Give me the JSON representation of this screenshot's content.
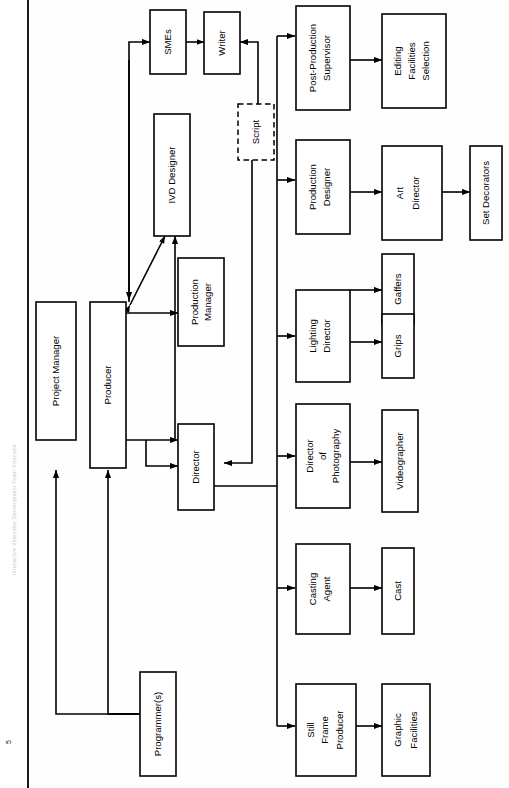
{
  "document": {
    "page_number": "5",
    "side_caption": "Interactive Videodisc Development Team Structure"
  },
  "diagram": {
    "type": "organizational-flow-chart",
    "orientation": "rotated-90-counterclockwise",
    "nodes": [
      {
        "id": "project-manager",
        "label": "Project Manager",
        "lines": [
          "Project Manager"
        ],
        "style": "solid"
      },
      {
        "id": "producer",
        "label": "Producer",
        "lines": [
          "Producer"
        ],
        "style": "solid"
      },
      {
        "id": "programmers",
        "label": "Programmer(s)",
        "lines": [
          "Programmer(s)"
        ],
        "style": "solid"
      },
      {
        "id": "smes",
        "label": "SMEs",
        "lines": [
          "SMEs"
        ],
        "style": "solid"
      },
      {
        "id": "writer",
        "label": "Writer",
        "lines": [
          "Writer"
        ],
        "style": "solid"
      },
      {
        "id": "script",
        "label": "Script",
        "lines": [
          "Script"
        ],
        "style": "dashed"
      },
      {
        "id": "ivd-designer",
        "label": "IVD Designer",
        "lines": [
          "IVD Designer"
        ],
        "style": "solid"
      },
      {
        "id": "production-manager",
        "label": "Production Manager",
        "lines": [
          "Production",
          "Manager"
        ],
        "style": "solid"
      },
      {
        "id": "director",
        "label": "Director",
        "lines": [
          "Director"
        ],
        "style": "solid"
      },
      {
        "id": "post-production-supervisor",
        "label": "Post-Production Supervisor",
        "lines": [
          "Post-Production",
          "Supervisor"
        ],
        "style": "solid"
      },
      {
        "id": "editing-facilities-selection",
        "label": "Editing Facilities Selection",
        "lines": [
          "Editing",
          "Facilities",
          "Selection"
        ],
        "style": "solid"
      },
      {
        "id": "production-designer",
        "label": "Production Designer",
        "lines": [
          "Production",
          "Designer"
        ],
        "style": "solid"
      },
      {
        "id": "art-director",
        "label": "Art Director",
        "lines": [
          "Art",
          "Director"
        ],
        "style": "solid"
      },
      {
        "id": "set-decorators",
        "label": "Set Decorators",
        "lines": [
          "Set Decorators"
        ],
        "style": "solid"
      },
      {
        "id": "lighting-director",
        "label": "Lighting Director",
        "lines": [
          "Lighting",
          "Director"
        ],
        "style": "solid"
      },
      {
        "id": "gaffers",
        "label": "Gaffers",
        "lines": [
          "Gaffers"
        ],
        "style": "solid"
      },
      {
        "id": "grips",
        "label": "Grips",
        "lines": [
          "Grips"
        ],
        "style": "solid"
      },
      {
        "id": "director-of-photography",
        "label": "Director of Photography",
        "lines": [
          "Director",
          "of",
          "Photography"
        ],
        "style": "solid"
      },
      {
        "id": "videographer",
        "label": "Videographer",
        "lines": [
          "Videographer"
        ],
        "style": "solid"
      },
      {
        "id": "casting-agent",
        "label": "Casting Agent",
        "lines": [
          "Casting",
          "Agent"
        ],
        "style": "solid"
      },
      {
        "id": "cast",
        "label": "Cast",
        "lines": [
          "Cast"
        ],
        "style": "solid"
      },
      {
        "id": "still-frame-producer",
        "label": "Still Frame Producer",
        "lines": [
          "Still",
          "Frame",
          "Producer"
        ],
        "style": "solid"
      },
      {
        "id": "graphic-facilities",
        "label": "Graphic Facilities",
        "lines": [
          "Graphic",
          "Facilities"
        ],
        "style": "solid"
      }
    ],
    "edges": [
      {
        "from": "programmers",
        "to": "project-manager",
        "arrow": "single"
      },
      {
        "from": "programmers",
        "to": "producer",
        "arrow": "single"
      },
      {
        "from": "producer",
        "to": "programmers",
        "arrow": "single"
      },
      {
        "from": "producer",
        "to": "smes",
        "arrow": "single"
      },
      {
        "from": "smes",
        "to": "writer",
        "arrow": "double"
      },
      {
        "from": "script",
        "to": "writer",
        "arrow": "single"
      },
      {
        "from": "producer",
        "to": "ivd-designer",
        "arrow": "double"
      },
      {
        "from": "director",
        "to": "ivd-designer",
        "arrow": "single"
      },
      {
        "from": "producer",
        "to": "production-manager",
        "arrow": "single"
      },
      {
        "from": "producer",
        "to": "director",
        "arrow": "single"
      },
      {
        "from": "script",
        "to": "director",
        "arrow": "single"
      },
      {
        "from": "director",
        "to": "crew-bus",
        "arrow": "none"
      },
      {
        "from": "crew-bus",
        "to": "post-production-supervisor",
        "arrow": "single"
      },
      {
        "from": "crew-bus",
        "to": "production-designer",
        "arrow": "single"
      },
      {
        "from": "crew-bus",
        "to": "lighting-director",
        "arrow": "single"
      },
      {
        "from": "crew-bus",
        "to": "director-of-photography",
        "arrow": "single"
      },
      {
        "from": "crew-bus",
        "to": "casting-agent",
        "arrow": "single"
      },
      {
        "from": "crew-bus",
        "to": "still-frame-producer",
        "arrow": "single"
      },
      {
        "from": "post-production-supervisor",
        "to": "editing-facilities-selection",
        "arrow": "single"
      },
      {
        "from": "production-designer",
        "to": "art-director",
        "arrow": "single"
      },
      {
        "from": "art-director",
        "to": "set-decorators",
        "arrow": "single"
      },
      {
        "from": "lighting-director",
        "to": "gaffers",
        "arrow": "single"
      },
      {
        "from": "lighting-director",
        "to": "grips",
        "arrow": "single"
      },
      {
        "from": "director-of-photography",
        "to": "videographer",
        "arrow": "single"
      },
      {
        "from": "casting-agent",
        "to": "cast",
        "arrow": "single"
      },
      {
        "from": "still-frame-producer",
        "to": "graphic-facilities",
        "arrow": "single"
      }
    ]
  }
}
